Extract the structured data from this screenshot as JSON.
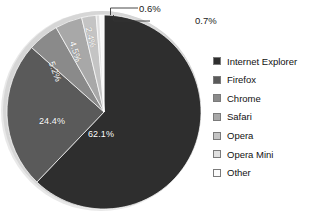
{
  "chart_data": {
    "type": "pie",
    "title": "",
    "subtitle": "",
    "xlabel": "",
    "ylabel": "",
    "grid": false,
    "legend_position": "right",
    "start_angle_deg": 0,
    "direction": "clockwise",
    "categories": [
      "Internet Explorer",
      "Firefox",
      "Chrome",
      "Safari",
      "Opera",
      "Opera Mini",
      "Other"
    ],
    "values": [
      62.1,
      24.4,
      5.2,
      4.5,
      2.4,
      0.6,
      0.7
    ],
    "value_labels": [
      "62.1%",
      "24.4%",
      "5.2%",
      "4.5%",
      "2.4%",
      "0.6%",
      "0.7%"
    ],
    "colors": [
      "#2e2e2e",
      "#5a5a5a",
      "#8a8a8a",
      "#a8a8a8",
      "#c4c4c4",
      "#e0e0e0",
      "#f8f8f8"
    ],
    "slices": [
      {
        "label": "Internet Explorer",
        "value": 62.1,
        "value_label": "62.1%",
        "color": "#2e2e2e",
        "label_style": "inside-horizontal"
      },
      {
        "label": "Firefox",
        "value": 24.4,
        "value_label": "24.4%",
        "color": "#5a5a5a",
        "label_style": "inside-horizontal"
      },
      {
        "label": "Chrome",
        "value": 5.2,
        "value_label": "5.2%",
        "color": "#8a8a8a",
        "label_style": "inside-rotated"
      },
      {
        "label": "Safari",
        "value": 4.5,
        "value_label": "4.5%",
        "color": "#a8a8a8",
        "label_style": "inside-rotated"
      },
      {
        "label": "Opera",
        "value": 2.4,
        "value_label": "2.4%",
        "color": "#c4c4c4",
        "label_style": "inside-rotated"
      },
      {
        "label": "Opera Mini",
        "value": 0.6,
        "value_label": "0.6%",
        "color": "#e0e0e0",
        "label_style": "callout"
      },
      {
        "label": "Other",
        "value": 0.7,
        "value_label": "0.7%",
        "color": "#f8f8f8",
        "label_style": "callout"
      }
    ]
  },
  "legend": {
    "items": [
      {
        "label": "Internet Explorer",
        "color": "#2e2e2e"
      },
      {
        "label": "Firefox",
        "color": "#5a5a5a"
      },
      {
        "label": "Chrome",
        "color": "#8a8a8a"
      },
      {
        "label": "Safari",
        "color": "#a8a8a8"
      },
      {
        "label": "Opera",
        "color": "#c4c4c4"
      },
      {
        "label": "Opera Mini",
        "color": "#e0e0e0"
      },
      {
        "label": "Other",
        "color": "#fbfbfb"
      }
    ]
  },
  "labels": {
    "ie": "62.1%",
    "firefox": "24.4%",
    "chrome": "5.2%",
    "safari": "4.5%",
    "opera": "2.4%",
    "opera_mini": "0.6%",
    "other": "0.7%"
  }
}
